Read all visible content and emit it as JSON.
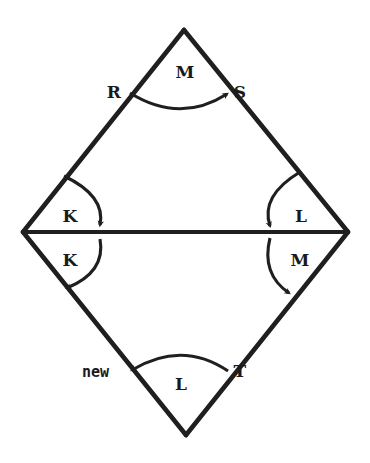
{
  "figure": {
    "background_color": "#ffffff",
    "stroke_color": "#1f1f1f",
    "text_color": "#1a1a1a",
    "shape": {
      "name": "rhombus",
      "vertices": {
        "top": {
          "x": 184,
          "y": 30
        },
        "left": {
          "x": 23,
          "y": 232
        },
        "right": {
          "x": 348,
          "y": 232
        },
        "bottom": {
          "x": 186,
          "y": 435
        }
      },
      "diagonal": {
        "from": {
          "x": 23,
          "y": 232
        },
        "to": {
          "x": 348,
          "y": 232
        }
      }
    },
    "vertex_labels": [
      {
        "id": "label-R",
        "text": "R",
        "x": 114,
        "y": 98
      },
      {
        "id": "label-S",
        "text": "S",
        "x": 240,
        "y": 98
      },
      {
        "id": "label-new",
        "text": "new",
        "x": 82,
        "y": 377
      },
      {
        "id": "label-T",
        "text": "T",
        "x": 240,
        "y": 377
      }
    ],
    "angle_labels": [
      {
        "id": "angle-top-M",
        "text": "M",
        "x": 178,
        "y": 78
      },
      {
        "id": "angle-left-upper-K",
        "text": "K",
        "x": 64,
        "y": 222
      },
      {
        "id": "angle-left-lower-K",
        "text": "K",
        "x": 64,
        "y": 265
      },
      {
        "id": "angle-right-upper-L",
        "text": "L",
        "x": 295,
        "y": 222
      },
      {
        "id": "angle-right-lower-M",
        "text": "M",
        "x": 293,
        "y": 266
      },
      {
        "id": "angle-bottom-L",
        "text": "L",
        "x": 174,
        "y": 390
      }
    ],
    "arcs": [
      {
        "id": "arc-top-M",
        "label": "M",
        "from": "R",
        "to": "S",
        "arrow_at": "S",
        "direction": "rightward"
      },
      {
        "id": "arc-left-upper-K",
        "label": "K",
        "from": "upper-left-edge",
        "to": "diagonal",
        "arrow_at": "diagonal",
        "direction": "downward"
      },
      {
        "id": "arc-left-lower-K",
        "label": "K",
        "from": "diagonal",
        "to": "lower-left-edge",
        "arrow_at": "lower-left-edge",
        "direction": "downward"
      },
      {
        "id": "arc-right-upper-L",
        "label": "L",
        "from": "upper-right-edge",
        "to": "diagonal",
        "arrow_at": "diagonal",
        "direction": "downward"
      },
      {
        "id": "arc-right-lower-M",
        "label": "M",
        "from": "diagonal",
        "to": "lower-right-edge",
        "arrow_at": "lower-right-edge",
        "direction": "downward"
      },
      {
        "id": "arc-bottom-L",
        "label": "L",
        "from": "T",
        "to": "new",
        "arrow_at": "new",
        "direction": "leftward"
      }
    ]
  }
}
